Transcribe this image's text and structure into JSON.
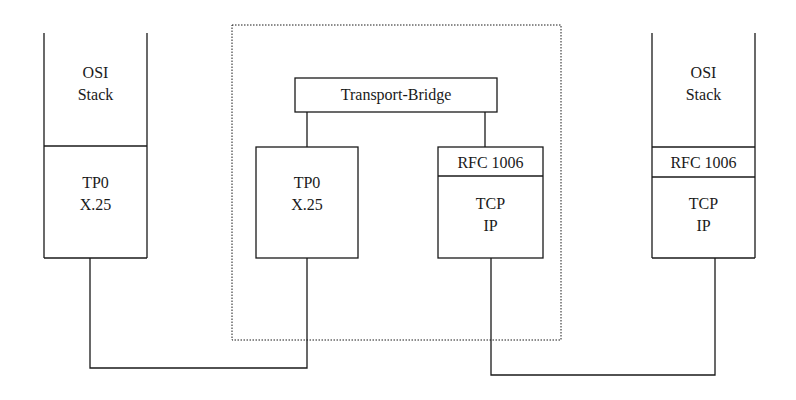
{
  "diagram": {
    "left_stack": {
      "upper": [
        "OSI",
        "Stack"
      ],
      "lower": [
        "TP0",
        "X.25"
      ]
    },
    "bridge": {
      "title": "Transport-Bridge",
      "left_box": [
        "TP0",
        "X.25"
      ],
      "right_box": {
        "header": "RFC 1006",
        "body": [
          "TCP",
          "IP"
        ]
      }
    },
    "right_stack": {
      "upper": [
        "OSI",
        "Stack"
      ],
      "middle": "RFC 1006",
      "lower": [
        "TCP",
        "IP"
      ]
    },
    "colors": {
      "line": "#1a1a1a",
      "background": "#ffffff"
    }
  }
}
